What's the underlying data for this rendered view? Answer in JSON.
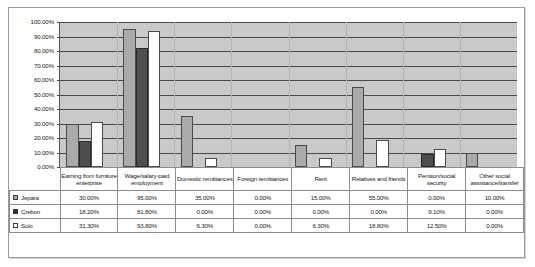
{
  "chart_data": {
    "type": "bar",
    "title": "",
    "xlabel": "",
    "ylabel": "",
    "ylim": [
      0,
      100
    ],
    "grid": true,
    "legend_position": "table-left",
    "yticks": [
      "0.00%",
      "10.00%",
      "20.00%",
      "30.00%",
      "40.00%",
      "50.00%",
      "60.00%",
      "70.00%",
      "80.00%",
      "90.00%",
      "100.00%"
    ],
    "categories": [
      "Earning from furniture enterprise",
      "Wage/salary-paid employment",
      "Domestic remittances",
      "Foreign remittances",
      "Rent",
      "Relatives and friends",
      "Pension/social security",
      "Other social assistance/transfer"
    ],
    "series": [
      {
        "name": "Jepara",
        "color": "#aaaaaa",
        "values": [
          30.0,
          95.0,
          35.0,
          0.0,
          15.0,
          55.0,
          0.0,
          10.0
        ],
        "labels": [
          "30.00%",
          "95.00%",
          "35.00%",
          "0.00%",
          "15.00%",
          "55.00%",
          "0.00%",
          "10.00%"
        ]
      },
      {
        "name": "Crebon",
        "color": "#4e4e4e",
        "values": [
          18.2,
          81.8,
          0.0,
          0.0,
          0.0,
          0.0,
          9.1,
          0.0
        ],
        "labels": [
          "18.20%",
          "81.80%",
          "0.00%",
          "0.00%",
          "0.00%",
          "0.00%",
          "9.10%",
          "0.00%"
        ]
      },
      {
        "name": "Solo",
        "color": "#ffffff",
        "values": [
          31.3,
          93.8,
          6.3,
          0.0,
          6.3,
          18.8,
          12.5,
          0.0
        ],
        "labels": [
          "31.30%",
          "93.80%",
          "6.30%",
          "0.00%",
          "6.30%",
          "18.80%",
          "12.50%",
          "0.00%"
        ]
      }
    ]
  }
}
